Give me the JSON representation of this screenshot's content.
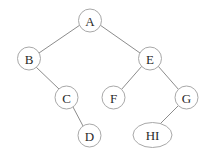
{
  "diagram": {
    "type": "binary-tree",
    "colors": {
      "background": "#ffffff",
      "edge": "#8c8c8c",
      "node_stroke": "#a8a8a8",
      "label": "#2a2a2a"
    },
    "nodes": [
      {
        "id": "A",
        "label": "A"
      },
      {
        "id": "B",
        "label": "B"
      },
      {
        "id": "E",
        "label": "E"
      },
      {
        "id": "C",
        "label": "C"
      },
      {
        "id": "F",
        "label": "F"
      },
      {
        "id": "G",
        "label": "G"
      },
      {
        "id": "D",
        "label": "D"
      },
      {
        "id": "HI",
        "label": "HI"
      }
    ],
    "edges": [
      {
        "from": "A",
        "to": "B"
      },
      {
        "from": "A",
        "to": "E"
      },
      {
        "from": "B",
        "to": "C"
      },
      {
        "from": "C",
        "to": "D"
      },
      {
        "from": "E",
        "to": "F"
      },
      {
        "from": "E",
        "to": "G"
      },
      {
        "from": "G",
        "to": "HI"
      }
    ]
  }
}
